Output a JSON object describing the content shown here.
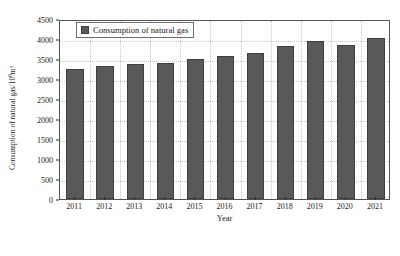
{
  "chart_data": {
    "type": "bar",
    "title": "",
    "subtitle": "",
    "xlabel": "Year",
    "ylabel": "Consumption of natural gas/10⁸m³",
    "ylabel_base": "Consumption of natural gas/10",
    "ylabel_exponent": "8",
    "ylabel_tail": "m³",
    "categories": [
      "2011",
      "2012",
      "2013",
      "2014",
      "2015",
      "2016",
      "2017",
      "2018",
      "2019",
      "2020",
      "2021"
    ],
    "values": [
      3240,
      3330,
      3380,
      3400,
      3490,
      3580,
      3650,
      3830,
      3940,
      3860,
      4020
    ],
    "series": [
      {
        "name": "Consumption of natural gas",
        "values": [
          3240,
          3330,
          3380,
          3400,
          3490,
          3580,
          3650,
          3830,
          3940,
          3860,
          4020
        ]
      }
    ],
    "ylim": [
      0,
      4500
    ],
    "ytick_values": [
      0,
      500,
      1000,
      1500,
      2000,
      2500,
      3000,
      3500,
      4000,
      4500
    ],
    "ytick_labels": [
      "0",
      "500",
      "1000",
      "1500",
      "2000",
      "2500",
      "3000",
      "3500",
      "4000",
      "4500"
    ],
    "grid": true,
    "grid_style": "dotted",
    "legend": {
      "position": "top-left-inside",
      "entries": [
        {
          "label": "Consumption of natural gas",
          "color": "#595959"
        }
      ]
    },
    "colors": {
      "bar_fill": "#595959",
      "bar_edge": "#3f3f3f",
      "frame": "#555555",
      "grid": "#c9c9c9",
      "text": "#1a1a1a",
      "background": "#ffffff"
    }
  }
}
